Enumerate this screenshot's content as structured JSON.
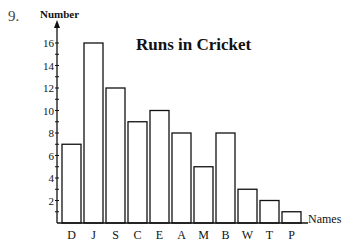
{
  "question_number": "9.",
  "chart_data": {
    "type": "bar",
    "title": "Runs in Cricket",
    "xlabel": "Names",
    "ylabel": "Number",
    "categories": [
      "D",
      "J",
      "S",
      "C",
      "E",
      "A",
      "M",
      "B",
      "W",
      "T",
      "P"
    ],
    "values": [
      7,
      16,
      12,
      9,
      10,
      8,
      5,
      8,
      3,
      2,
      1
    ],
    "y_ticks": [
      2,
      4,
      6,
      8,
      10,
      12,
      14,
      16
    ],
    "ylim": [
      0,
      17
    ],
    "grid": false,
    "legend": null,
    "bar_fill": "#ffffff",
    "bar_stroke": "#111111"
  }
}
